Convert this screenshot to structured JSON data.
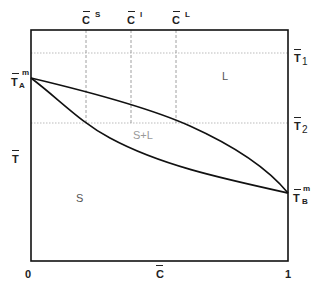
{
  "diagram": {
    "type": "binary phase diagram",
    "x_axis": {
      "label": "C",
      "ticks": [
        "0",
        "1"
      ]
    },
    "y_axis": {
      "label": "T"
    },
    "top_markers": [
      {
        "label": "C",
        "sup": "S"
      },
      {
        "label": "C",
        "sup": "l"
      },
      {
        "label": "C",
        "sup": "L"
      }
    ],
    "right_markers": [
      {
        "label": "T",
        "sub": "1"
      },
      {
        "label": "T",
        "sub": "2"
      }
    ],
    "melting_points": {
      "A": {
        "label": "T",
        "sub": "A",
        "sup": "m"
      },
      "B": {
        "label": "T",
        "sub": "B",
        "sup": "m"
      }
    },
    "regions": {
      "liquid": "L",
      "two_phase": "S+L",
      "solid": "S"
    },
    "colors": {
      "line": "#111111",
      "guide": "#9a9a9a",
      "region_text": "#555555",
      "two_phase_text": "#9a9a9a"
    }
  }
}
